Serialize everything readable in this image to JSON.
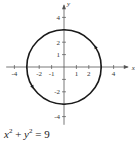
{
  "chart_data": {
    "type": "line",
    "title": "",
    "caption": "x^2 + y^2 = 9",
    "equation": {
      "lhs_var1": "x",
      "exp1": "2",
      "plus": "+",
      "lhs_var2": "y",
      "exp2": "2",
      "equals": "=",
      "rhs": "9"
    },
    "xlabel": "x",
    "ylabel": "y",
    "xlim": [
      -4.5,
      4.5
    ],
    "ylim": [
      -4.5,
      4.5
    ],
    "x_ticks": [
      -4,
      -3,
      -2,
      -1,
      1,
      2,
      3,
      4
    ],
    "x_tick_labels": [
      "-4",
      "-2",
      "-1",
      "1",
      "2",
      "4"
    ],
    "x_tick_label_values": [
      -4,
      -2,
      -1,
      1,
      2,
      4
    ],
    "y_ticks": [
      -4,
      -3,
      -2,
      -1,
      1,
      2,
      3,
      4
    ],
    "y_tick_labels": [
      "4",
      "2",
      "1",
      "-2",
      "-4"
    ],
    "y_tick_label_values": [
      4,
      2,
      1,
      -2,
      -4
    ],
    "grid": false,
    "series": [
      {
        "name": "circle",
        "shape": "circle",
        "center": [
          0,
          0
        ],
        "radius": 3,
        "orientation_arrows": "counterclockwise",
        "arrow_points_deg": [
          30,
          210
        ]
      }
    ]
  },
  "colors": {
    "curve": "#1a1a1a",
    "axis": "#555555",
    "text": "#333333"
  }
}
